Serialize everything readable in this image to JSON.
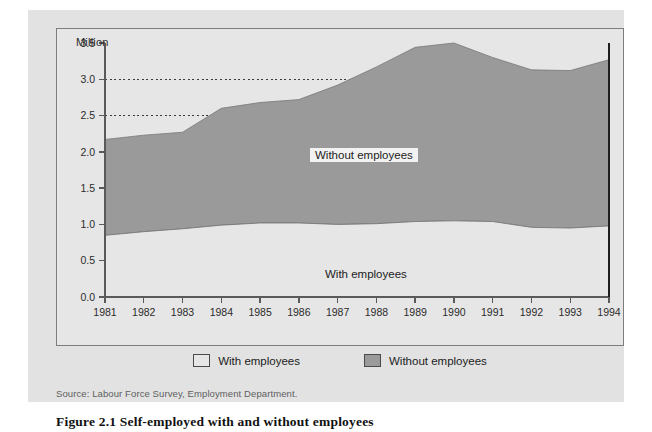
{
  "figure": {
    "caption": "Figure 2.1  Self-employed with and without employees",
    "source": "Source: Labour Force Survey, Employment Department."
  },
  "colors": {
    "panel_background": "#e2e2e2",
    "plot_background": "#e6e6e6",
    "series_without_employees": "#9a9a9a",
    "series_with_employees": "#e6e6e6",
    "axis": "#5a5a5a",
    "gridline": "#3c3c3c"
  },
  "inline_labels": {
    "without": "Without employees",
    "with": "With employees"
  },
  "legend": {
    "items": [
      {
        "label": "With employees",
        "color": "#e6e6e6"
      },
      {
        "label": "Without employees",
        "color": "#9a9a9a"
      }
    ]
  },
  "chart_data": {
    "type": "area",
    "stacked": true,
    "title": "Figure 2.1  Self-employed with and without employees",
    "subtitle": "",
    "xlabel": "",
    "ylabel": "Million",
    "unit_label": "Million",
    "grid": true,
    "legend_position": "bottom",
    "categories": [
      "1981",
      "1982",
      "1983",
      "1984",
      "1985",
      "1986",
      "1987",
      "1988",
      "1989",
      "1990",
      "1991",
      "1992",
      "1993",
      "1994"
    ],
    "x": [
      1981,
      1982,
      1983,
      1984,
      1985,
      1986,
      1987,
      1988,
      1989,
      1990,
      1991,
      1992,
      1993,
      1994
    ],
    "xlim": [
      1981,
      1994
    ],
    "ylim": [
      0.0,
      3.5
    ],
    "yticks": [
      0.0,
      0.5,
      1.0,
      1.5,
      2.0,
      2.5,
      3.0,
      3.5
    ],
    "ytick_labels": [
      "0.0",
      "0.5",
      "1.0",
      "1.5",
      "2.0",
      "2.5",
      "3.0",
      "3.5"
    ],
    "series": [
      {
        "name": "With employees",
        "color": "#e6e6e6",
        "values": [
          0.85,
          0.9,
          0.94,
          0.99,
          1.02,
          1.02,
          1.0,
          1.01,
          1.04,
          1.05,
          1.04,
          0.96,
          0.95,
          0.98
        ]
      },
      {
        "name": "Without employees",
        "color": "#9a9a9a",
        "values": [
          1.32,
          1.33,
          1.33,
          1.61,
          1.66,
          1.7,
          1.92,
          2.16,
          2.4,
          2.45,
          2.26,
          2.17,
          2.17,
          2.29
        ]
      }
    ],
    "totals": {
      "name": "Total self-employed",
      "values": [
        2.17,
        2.23,
        2.27,
        2.6,
        2.68,
        2.72,
        2.92,
        3.17,
        3.44,
        3.5,
        3.3,
        3.13,
        3.12,
        3.27
      ]
    }
  }
}
